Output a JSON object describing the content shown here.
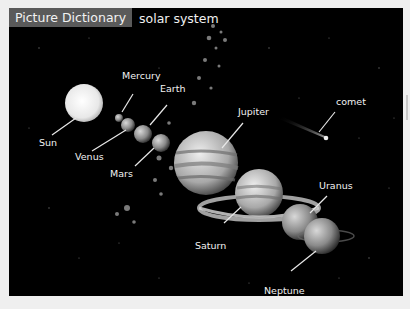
{
  "header": {
    "tag_label": "Picture Dictionary",
    "title": "solar system"
  },
  "labels": {
    "sun": "Sun",
    "mercury": "Mercury",
    "venus": "Venus",
    "earth": "Earth",
    "mars": "Mars",
    "jupiter": "Jupiter",
    "saturn": "Saturn",
    "uranus": "Uranus",
    "neptune": "Neptune",
    "comet": "comet"
  },
  "colors": {
    "background": "#efefef",
    "panel": "#000000",
    "tag": "#5a5a5a",
    "text": "#f2f2f2"
  }
}
